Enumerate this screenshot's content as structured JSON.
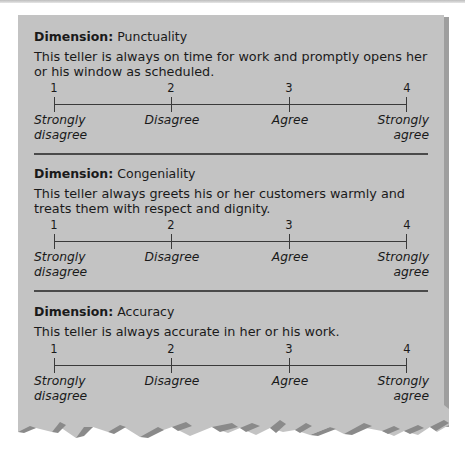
{
  "colors": {
    "card_background": "#c3c3c3",
    "card_shadow": "#9e9e9e",
    "torn_edge_shadow": "#8a8a8a",
    "separator": "#4a4a4a",
    "text": "#1a1a1a"
  },
  "scale": {
    "points": [
      "1",
      "2",
      "3",
      "4"
    ],
    "anchors": {
      "p1_line1": "Strongly",
      "p1_line2": "disagree",
      "p2": "Disagree",
      "p3": "Agree",
      "p4_line1": "Strongly",
      "p4_line2": "agree"
    }
  },
  "dimensions": [
    {
      "label": "Dimension:",
      "name": "Punctuality",
      "description": "This teller is always on time for work and promptly opens her or his window as scheduled."
    },
    {
      "label": "Dimension:",
      "name": "Congeniality",
      "description": "This teller always greets his or her customers warmly and treats them with respect and dignity."
    },
    {
      "label": "Dimension:",
      "name": "Accuracy",
      "description": "This teller is always accurate in her or his work."
    }
  ]
}
